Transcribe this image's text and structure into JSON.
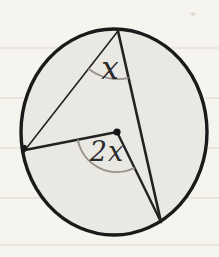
{
  "figure": {
    "labels": {
      "inscribed_angle": "x",
      "central_angle": "2x"
    },
    "colors": {
      "paper": "#f6f4ef",
      "ruled_line": "#dbd6cf",
      "circle_fill": "#e9e8e3",
      "ink": "#222222",
      "ink_dark": "#1a1a1a",
      "arc": "#96928a",
      "stray_mark": "#d6d1c9"
    },
    "geometry": {
      "circle": {
        "cx": 114,
        "cy": 132,
        "rx": 93,
        "ry": 103
      },
      "center": {
        "x": 117,
        "y": 132
      },
      "top_vertex": {
        "x": 118,
        "y": 31
      },
      "left_vertex": {
        "x": 25,
        "y": 150
      },
      "bottom_vertex": {
        "x": 161,
        "y": 222
      },
      "inscribed_arc_radius": 48,
      "central_arc_radius": 40,
      "label_x_pos": {
        "x": 110,
        "y": 79
      },
      "label_2x_pos": {
        "x": 107,
        "y": 161
      },
      "stray_mark_pos": {
        "x": 193,
        "y": 14
      }
    },
    "ruled_line_ys": [
      48,
      98,
      148,
      198,
      245
    ]
  }
}
